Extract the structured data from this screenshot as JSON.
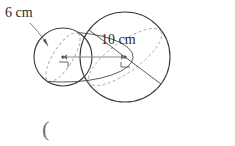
{
  "figure": {
    "type": "two-spheres-diagram",
    "stroke_color": "#3a3a3a",
    "dashed_color": "#a0a0a0",
    "measure_line_color": "#8a8a8a",
    "small_sphere": {
      "label": "6 cm",
      "measure_kind": "radius",
      "measure_value": 6,
      "unit": "cm",
      "center_x": 63,
      "center_y": 57,
      "radius_px": 29,
      "right_angle_mark": "top-right-corner"
    },
    "large_sphere": {
      "label": "10 cm",
      "measure_kind": "radius",
      "measure_value": 10,
      "unit": "cm",
      "center_x": 125,
      "center_y": 57,
      "radius_px": 45,
      "right_angle_mark": "bottom-left-corner"
    },
    "pointer_arrow": {
      "name": "label-pointer",
      "from_x": 30,
      "from_y": 24,
      "to_x": 48,
      "to_y": 46
    },
    "center_connector": {
      "name": "center-to-center-line",
      "from_x": 63,
      "from_y": 57,
      "to_x": 125,
      "to_y": 57,
      "arrowheads": "both"
    }
  },
  "answer": {
    "open_paren": "(",
    "close_paren": ")",
    "value": "",
    "placeholder": ""
  }
}
